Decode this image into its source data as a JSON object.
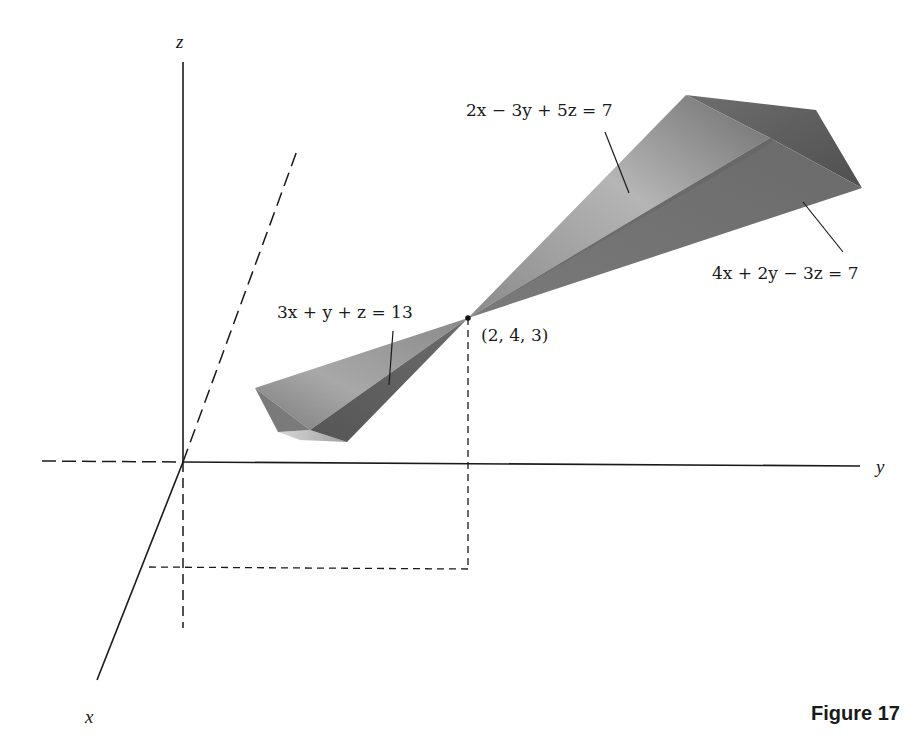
{
  "figure": {
    "caption": "Figure 17",
    "axes": {
      "x_label": "x",
      "y_label": "y",
      "z_label": "z"
    },
    "point": {
      "label": "(2, 4, 3)",
      "coordinates": [
        2,
        4,
        3
      ]
    },
    "planes": [
      {
        "id": "plane-1",
        "equation": "2x − 3y + 5z = 7"
      },
      {
        "id": "plane-2",
        "equation": "4x + 2y − 3z = 7"
      },
      {
        "id": "plane-3",
        "equation": "3x + y + z = 13"
      }
    ],
    "colors": {
      "line": "#1a1a1a",
      "plane_dark": "#5a5a5a",
      "plane_mid": "#7d7d7d",
      "plane_light": "#b8b8b8",
      "background": "#ffffff"
    }
  }
}
